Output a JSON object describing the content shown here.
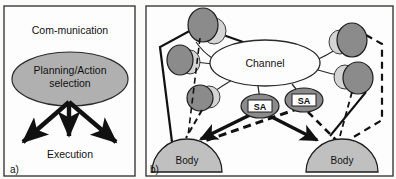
{
  "figure": {
    "kind": "two-panel schematic diagram",
    "background_color": "#fbfbfa",
    "panel_border_color": "#3a3a3a",
    "ink_color": "#111111",
    "fill_light_gray": "#c9c9c9",
    "fill_mid_gray": "#b0b0b0",
    "fill_dark_gray": "#8b8b8b",
    "fill_white": "#fdfdfd"
  },
  "panel_a": {
    "caption": "a)",
    "communication": {
      "label": "Com-munication",
      "shape": "dome"
    },
    "planning": {
      "label_line1": "Planning/Action",
      "label_line2": "selection",
      "shape": "ellipse"
    },
    "execution": {
      "label": "Execution",
      "arrow_count": 3,
      "arrow_directions": [
        "down-left",
        "down",
        "down-right"
      ]
    }
  },
  "panel_b": {
    "caption": "b)",
    "channel": {
      "label": "Channel",
      "shape": "ellipse"
    },
    "agents": [
      {
        "id": "sa-left",
        "label": "SA"
      },
      {
        "id": "sa-right",
        "label": "SA"
      }
    ],
    "bodies": [
      {
        "id": "body-left",
        "label": "Body"
      },
      {
        "id": "body-right",
        "label": "Body"
      }
    ],
    "nodes": [
      {
        "id": "node-top-left",
        "cx": 203,
        "cy": 25,
        "rx": 15,
        "ry": 17,
        "shadow": "right"
      },
      {
        "id": "node-mid-left",
        "cx": 180,
        "cy": 60,
        "rx": 13,
        "ry": 15,
        "shadow": "right"
      },
      {
        "id": "node-low-left",
        "cx": 200,
        "cy": 98,
        "rx": 13,
        "ry": 13,
        "shadow": "right"
      },
      {
        "id": "node-top-right",
        "cx": 352,
        "cy": 40,
        "rx": 15,
        "ry": 17,
        "shadow": "left"
      },
      {
        "id": "node-low-right",
        "cx": 358,
        "cy": 78,
        "rx": 15,
        "ry": 16,
        "shadow": "left"
      }
    ],
    "link_styles": [
      "solid-thin",
      "solid-thick",
      "dashed-thick",
      "arrow-thick"
    ]
  }
}
